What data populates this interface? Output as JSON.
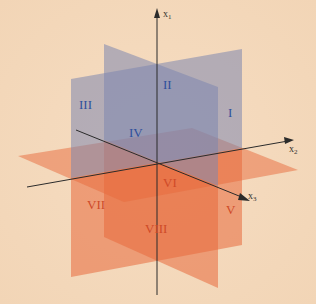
{
  "diagram": {
    "colors": {
      "background": "#f4d9bd",
      "upper_plane_fill": "#7e86ae",
      "lower_plane_fill": "#e86a3c",
      "upper_numerals": "#2f4f9c",
      "lower_numerals": "#cf4a28",
      "axis": "#2b2b2b"
    },
    "axes": [
      {
        "name": "x1",
        "base": "x",
        "sub": "1"
      },
      {
        "name": "x2",
        "base": "x",
        "sub": "2"
      },
      {
        "name": "x3",
        "base": "x",
        "sub": "3"
      }
    ],
    "octants": [
      {
        "label": "I",
        "group": "upper"
      },
      {
        "label": "II",
        "group": "upper"
      },
      {
        "label": "III",
        "group": "upper"
      },
      {
        "label": "IV",
        "group": "upper"
      },
      {
        "label": "V",
        "group": "lower"
      },
      {
        "label": "VI",
        "group": "lower"
      },
      {
        "label": "VII",
        "group": "lower"
      },
      {
        "label": "VIII",
        "group": "lower"
      }
    ]
  }
}
